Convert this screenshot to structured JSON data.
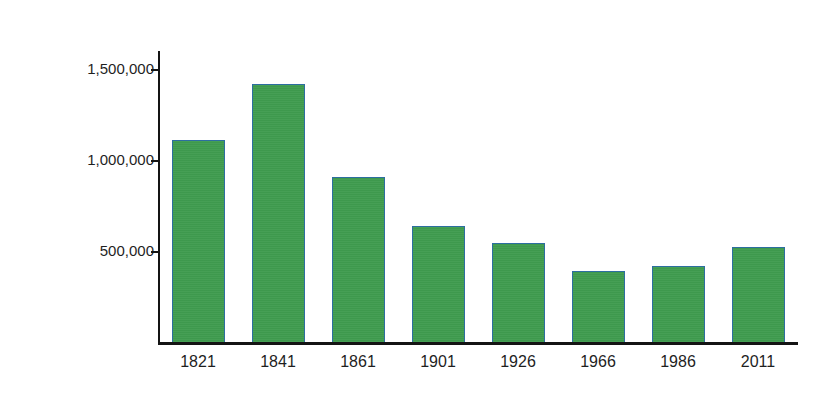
{
  "chart_data": {
    "type": "bar",
    "title": "",
    "xlabel": "",
    "ylabel": "Population of Connacht",
    "categories": [
      "1821",
      "1841",
      "1861",
      "1901",
      "1926",
      "1966",
      "1986",
      "2011"
    ],
    "values": [
      1110000,
      1420000,
      910000,
      640000,
      545000,
      390000,
      420000,
      525000
    ],
    "ylim": [
      0,
      1600000
    ],
    "ytick_values": [
      500000,
      1000000,
      1500000
    ],
    "ytick_labels": [
      "500,000",
      "1,000,000",
      "1,500,000"
    ],
    "grid": false,
    "legend": false,
    "legend_position": "none",
    "bar_color": "#3f9c4f",
    "bar_edge_color": "#2d6ea0",
    "axis_color": "#141414",
    "background_color": "#ffffff",
    "series": [
      {
        "name": "Population of Connacht",
        "values": [
          1110000,
          1420000,
          910000,
          640000,
          545000,
          390000,
          420000,
          525000
        ]
      }
    ],
    "points": [
      {
        "category": "1821",
        "value": 1110000
      },
      {
        "category": "1841",
        "value": 1420000
      },
      {
        "category": "1861",
        "value": 910000
      },
      {
        "category": "1901",
        "value": 640000
      },
      {
        "category": "1926",
        "value": 545000
      },
      {
        "category": "1966",
        "value": 390000
      },
      {
        "category": "1986",
        "value": 420000
      },
      {
        "category": "2011",
        "value": 525000
      }
    ]
  }
}
